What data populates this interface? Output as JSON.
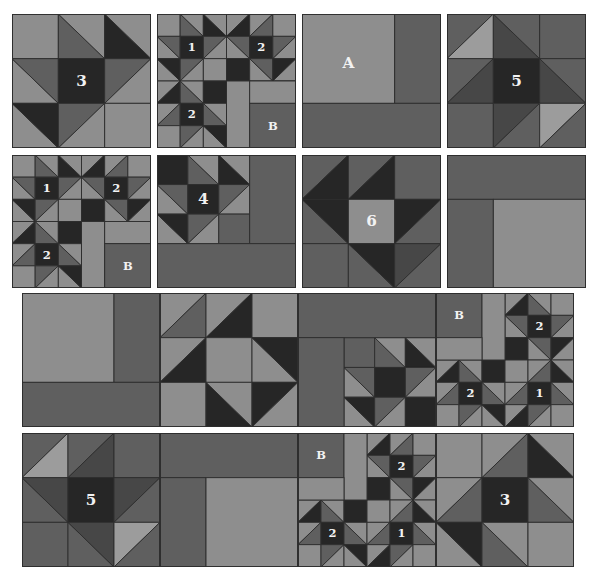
{
  "colors": {
    "light": "#8e8e8e",
    "medium": "#5f5f5f",
    "dark": "#262626",
    "pale": "#9c9c9c",
    "line": "#2e2e2e",
    "label": "#f2f2f2"
  },
  "blocks": [
    {
      "id": "block-3",
      "label": "3",
      "x": 12,
      "y": 14,
      "w": 139,
      "h": 134,
      "grid": 3,
      "cells": [
        [
          "L",
          "TLBR:M/L",
          "TLBR:D/L"
        ],
        [
          "TLBR:L/M",
          "D",
          "BLTR:M/L"
        ],
        [
          "TLBR:L/D",
          "BLTR:M/L",
          "L"
        ]
      ],
      "labels": [
        {
          "text": "3",
          "r": 1,
          "c": 1
        }
      ]
    },
    {
      "id": "block-1-2-2-b",
      "x": 157,
      "y": 14,
      "w": 139,
      "h": 134,
      "grid": 6,
      "cells": [
        [
          "L",
          "TLBR:M/L",
          "TLBR:D/L",
          "BLTR:L/D",
          "BLTR:L/M",
          "L"
        ],
        [
          "TLBR:L/M",
          "D",
          "BLTR:M/L",
          "TLBR:L/M",
          "D",
          "BLTR:M/L"
        ],
        [
          "TLBR:L/D",
          "BLTR:M/L",
          "L",
          "D",
          "TLBR:L/M",
          "BLTR:D/L"
        ],
        [
          "BLTR:L/D",
          "TLBR:M/L",
          "D",
          "L",
          "L",
          "L"
        ],
        [
          "BLTR:L/M",
          "D",
          "TLBR:M/L",
          "L",
          "M",
          "M"
        ],
        [
          "L",
          "BLTR:M/L",
          "TLBR:L/D",
          "L",
          "M",
          "M"
        ]
      ],
      "merges": [
        {
          "r": 3,
          "c": 3,
          "rs": 3,
          "cs": 1,
          "fill": "L"
        },
        {
          "r": 3,
          "c": 4,
          "rs": 1,
          "cs": 2,
          "fill": "L"
        },
        {
          "r": 4,
          "c": 4,
          "rs": 2,
          "cs": 2,
          "fill": "M"
        }
      ],
      "labels": [
        {
          "text": "1",
          "r": 1,
          "c": 1
        },
        {
          "text": "2",
          "r": 1,
          "c": 4
        },
        {
          "text": "2",
          "r": 4,
          "c": 1
        },
        {
          "text": "B",
          "r": 4.5,
          "c": 4.5
        }
      ]
    },
    {
      "id": "block-a",
      "x": 302,
      "y": 14,
      "w": 139,
      "h": 134,
      "grid": 3,
      "rects": [
        {
          "r": 0,
          "c": 0,
          "rs": 2,
          "cs": 2,
          "fill": "L"
        },
        {
          "r": 0,
          "c": 2,
          "rs": 2,
          "cs": 1,
          "fill": "M"
        },
        {
          "r": 2,
          "c": 0,
          "rs": 1,
          "cs": 3,
          "fill": "M"
        }
      ],
      "labels": [
        {
          "text": "A",
          "r": 0.6,
          "c": 0.5
        }
      ]
    },
    {
      "id": "block-5",
      "label": "5",
      "x": 447,
      "y": 14,
      "w": 139,
      "h": 134,
      "grid": 3,
      "cells": [
        [
          "BLTR:M/P",
          "TLBR:X/M",
          "M"
        ],
        [
          "BLTR:M/X",
          "D",
          "TLBR:X/M"
        ],
        [
          "M",
          "BLTR:X/M",
          "BLTR:P/M"
        ]
      ],
      "labels": [
        {
          "text": "5",
          "r": 1,
          "c": 1
        }
      ]
    },
    {
      "id": "block-1-2-2-b-row2",
      "x": 12,
      "y": 155,
      "w": 139,
      "h": 133,
      "grid": 6,
      "ref": "block-1-2-2-b"
    },
    {
      "id": "block-4",
      "x": 157,
      "y": 155,
      "w": 139,
      "h": 133,
      "grid": 4.5,
      "cells": [
        [
          "D",
          "TLBR:M/L",
          "TLBR:D/L"
        ],
        [
          "TLBR:L/M",
          "D",
          "BLTR:M/L"
        ],
        [
          "TLBR:L/D",
          "BLTR:M/L",
          "M"
        ]
      ],
      "rects": [
        {
          "r": 0,
          "c": 3,
          "rs": 3,
          "cs": 1.5,
          "fill": "M"
        },
        {
          "r": 3,
          "c": 0,
          "rs": 1.5,
          "cs": 4.5,
          "fill": "M"
        }
      ],
      "labels": [
        {
          "text": "4",
          "r": 1,
          "c": 1
        }
      ]
    },
    {
      "id": "block-6",
      "x": 302,
      "y": 155,
      "w": 139,
      "h": 133,
      "grid": 3,
      "cells": [
        [
          "BLTR:M/D",
          "BLTR:M/D",
          "M"
        ],
        [
          "TLBR:M/D",
          "L",
          "BLTR:D/M"
        ],
        [
          "M",
          "TLBR:M/D",
          "BLTR:X/M"
        ]
      ],
      "labels": [
        {
          "text": "6",
          "r": 1,
          "c": 1
        }
      ]
    },
    {
      "id": "block-corner",
      "x": 447,
      "y": 155,
      "w": 139,
      "h": 133,
      "grid": 3,
      "rects": [
        {
          "r": 0,
          "c": 0,
          "rs": 1,
          "cs": 3,
          "fill": "M"
        },
        {
          "r": 1,
          "c": 0,
          "rs": 2,
          "cs": 1,
          "fill": "M"
        },
        {
          "r": 1,
          "c": 1,
          "rs": 2,
          "cs": 2,
          "fill": "L"
        }
      ],
      "labels": []
    },
    {
      "id": "row3-a",
      "x": 22,
      "y": 293,
      "w": 138,
      "h": 134,
      "grid": 3,
      "rects": [
        {
          "r": 0,
          "c": 0,
          "rs": 2,
          "cs": 2,
          "fill": "L"
        },
        {
          "r": 0,
          "c": 2,
          "rs": 2,
          "cs": 1,
          "fill": "M"
        },
        {
          "r": 2,
          "c": 0,
          "rs": 1,
          "cs": 3,
          "fill": "M"
        }
      ],
      "labels": []
    },
    {
      "id": "row3-6",
      "x": 160,
      "y": 293,
      "w": 138,
      "h": 134,
      "grid": 3,
      "cells": [
        [
          "BLTR:L/M",
          "BLTR:L/D",
          "L"
        ],
        [
          "BLTR:L/D",
          "L",
          "TLBR:L/D"
        ],
        [
          "L",
          "TLBR:D/L",
          "BLTR:D/L"
        ]
      ],
      "labels": []
    },
    {
      "id": "row3-corner4",
      "x": 298,
      "y": 293,
      "w": 138,
      "h": 134,
      "grid": 4.5,
      "rects": [
        {
          "r": 0,
          "c": 0,
          "rs": 1.5,
          "cs": 4.5,
          "fill": "M"
        },
        {
          "r": 1.5,
          "c": 0,
          "rs": 3,
          "cs": 1.5,
          "fill": "M"
        }
      ],
      "sub": {
        "r": 1.5,
        "c": 1.5,
        "cells": [
          [
            "M",
            "TLBR:M/L",
            "TLBR:D/L"
          ],
          [
            "TLBR:L/M",
            "D",
            "BLTR:M/L"
          ],
          [
            "TLBR:L/D",
            "BLTR:M/L",
            "D"
          ]
        ]
      },
      "labels": []
    },
    {
      "id": "row3-122b",
      "x": 436,
      "y": 293,
      "w": 138,
      "h": 134,
      "grid": 6,
      "cells": [
        [
          "M",
          "M",
          "L",
          "BLTR:L/D",
          "TLBR:M/L",
          "L"
        ],
        [
          "M",
          "M",
          "L",
          "TLBR:L/M",
          "D",
          "BLTR:M/L"
        ],
        [
          "L",
          "L",
          "L",
          "D",
          "TLBR:L/M",
          "BLTR:D/L"
        ],
        [
          "BLTR:L/D",
          "TLBR:M/L",
          "D",
          "L",
          "BLTR:L/M",
          "TLBR:D/L"
        ],
        [
          "BLTR:L/M",
          "D",
          "TLBR:M/L",
          "BLTR:L/M",
          "D",
          "TLBR:M/L"
        ],
        [
          "L",
          "BLTR:M/L",
          "TLBR:L/D",
          "BLTR:L/D",
          "BLTR:M/L",
          "L"
        ]
      ],
      "merges": [
        {
          "r": 0,
          "c": 0,
          "rs": 2,
          "cs": 2,
          "fill": "M"
        },
        {
          "r": 0,
          "c": 2,
          "rs": 3,
          "cs": 1,
          "fill": "L"
        },
        {
          "r": 2,
          "c": 0,
          "rs": 1,
          "cs": 2,
          "fill": "L"
        }
      ],
      "labels": [
        {
          "text": "B",
          "r": 0.5,
          "c": 0.5
        },
        {
          "text": "2",
          "r": 1,
          "c": 4
        },
        {
          "text": "2",
          "r": 4,
          "c": 1
        },
        {
          "text": "1",
          "r": 4,
          "c": 4
        }
      ]
    },
    {
      "id": "row4-5",
      "x": 22,
      "y": 433,
      "w": 138,
      "h": 134,
      "grid": 3,
      "cells": [
        [
          "BLTR:M/P",
          "BLTR:M/X",
          "M"
        ],
        [
          "TLBR:M/X",
          "D",
          "BLTR:X/M"
        ],
        [
          "M",
          "TLBR:M/X",
          "BLTR:P/M"
        ]
      ],
      "labels": [
        {
          "text": "5",
          "r": 1,
          "c": 1
        }
      ]
    },
    {
      "id": "row4-corner",
      "x": 160,
      "y": 433,
      "w": 138,
      "h": 134,
      "grid": 3,
      "rects": [
        {
          "r": 0,
          "c": 0,
          "rs": 1,
          "cs": 3,
          "fill": "M"
        },
        {
          "r": 1,
          "c": 0,
          "rs": 2,
          "cs": 1,
          "fill": "M"
        },
        {
          "r": 1,
          "c": 1,
          "rs": 2,
          "cs": 2,
          "fill": "L"
        }
      ],
      "labels": []
    },
    {
      "id": "row4-b122",
      "x": 298,
      "y": 433,
      "w": 138,
      "h": 134,
      "grid": 6,
      "cells": [
        [
          "M",
          "M",
          "L",
          "BLTR:L/D",
          "BLTR:L/M",
          "L"
        ],
        [
          "M",
          "M",
          "L",
          "TLBR:L/M",
          "D",
          "BLTR:M/L"
        ],
        [
          "L",
          "L",
          "L",
          "D",
          "TLBR:L/M",
          "BLTR:D/L"
        ],
        [
          "BLTR:L/D",
          "TLBR:M/L",
          "D",
          "L",
          "BLTR:L/M",
          "TLBR:D/L"
        ],
        [
          "BLTR:L/M",
          "D",
          "TLBR:M/L",
          "BLTR:L/M",
          "D",
          "TLBR:M/L"
        ],
        [
          "L",
          "BLTR:M/L",
          "TLBR:L/D",
          "BLTR:L/D",
          "BLTR:M/L",
          "L"
        ]
      ],
      "merges": [
        {
          "r": 0,
          "c": 0,
          "rs": 2,
          "cs": 2,
          "fill": "M"
        },
        {
          "r": 0,
          "c": 2,
          "rs": 3,
          "cs": 1,
          "fill": "L"
        },
        {
          "r": 2,
          "c": 0,
          "rs": 1,
          "cs": 2,
          "fill": "L"
        }
      ],
      "labels": [
        {
          "text": "B",
          "r": 0.5,
          "c": 0.5
        },
        {
          "text": "2",
          "r": 1,
          "c": 4
        },
        {
          "text": "2",
          "r": 4,
          "c": 1
        },
        {
          "text": "1",
          "r": 4,
          "c": 4
        }
      ]
    },
    {
      "id": "row4-3",
      "x": 436,
      "y": 433,
      "w": 138,
      "h": 134,
      "grid": 3,
      "cells": [
        [
          "L",
          "BLTR:L/M",
          "TLBR:D/L"
        ],
        [
          "BLTR:L/M",
          "D",
          "TLBR:M/L"
        ],
        [
          "TLBR:L/D",
          "TLBR:M/L",
          "L"
        ]
      ],
      "labels": [
        {
          "text": "3",
          "r": 1,
          "c": 1
        }
      ]
    }
  ]
}
